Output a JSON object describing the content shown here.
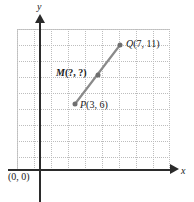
{
  "figure": {
    "type": "coordinate-plane-midpoint-diagram",
    "axes": {
      "x_label": "x",
      "y_label": "y",
      "origin_label": "(0, 0)"
    },
    "points": [
      {
        "id": "P",
        "label": "P(3, 6)",
        "name": "P",
        "coords": "(3, 6)",
        "x": 3,
        "y": 6,
        "px": 75,
        "py": 104
      },
      {
        "id": "M",
        "label": "M(?, ?)",
        "name": "M",
        "coords": "(?, ?)",
        "x": null,
        "y": null,
        "px": 98,
        "py": 75
      },
      {
        "id": "Q",
        "label": "Q(7, 11)",
        "name": "Q",
        "coords": "(7, 11)",
        "x": 7,
        "y": 11,
        "px": 120,
        "py": 45
      }
    ],
    "segment": {
      "from": "P",
      "to": "Q",
      "through": "M",
      "color": "#8a8a8a"
    },
    "colors": {
      "axis": "#2b2b2b",
      "grid": "#a8a8a8",
      "point": "#6f6f6f",
      "segment": "#8a8a8a",
      "text": "#1a1a1a"
    }
  },
  "chart_data": {
    "type": "scatter",
    "title": "",
    "xlabel": "x",
    "ylabel": "y",
    "grid": true,
    "legend": null,
    "annotations": [
      "(0, 0)",
      "P(3, 6)",
      "M(?, ?)",
      "Q(7, 11)"
    ],
    "series": [
      {
        "name": "segment PQ",
        "points": [
          {
            "label": "P(3, 6)",
            "x": 3,
            "y": 6
          },
          {
            "label": "M(?, ?)",
            "x": null,
            "y": null
          },
          {
            "label": "Q(7, 11)",
            "x": 7,
            "y": 11
          }
        ]
      }
    ]
  }
}
